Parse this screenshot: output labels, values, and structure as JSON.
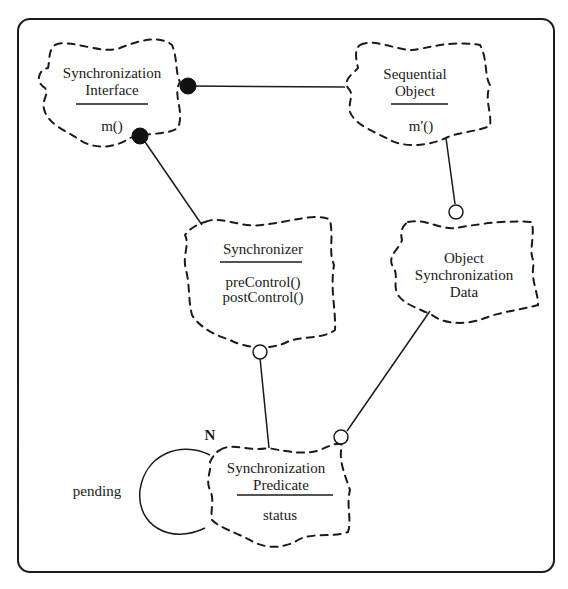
{
  "diagram": {
    "type": "Booch class diagram",
    "classes": [
      {
        "id": "synchronization-interface",
        "name_lines": [
          "Synchronization",
          "Interface"
        ],
        "operations": [
          "m()"
        ]
      },
      {
        "id": "sequential-object",
        "name_lines": [
          "Sequential",
          "Object"
        ],
        "operations": [
          "m'()"
        ]
      },
      {
        "id": "synchronizer",
        "name_lines": [
          "Synchronizer"
        ],
        "operations": [
          "preControl()",
          "postControl()"
        ]
      },
      {
        "id": "object-synchronization-data",
        "name_lines": [
          "Object",
          "Synchronization",
          "Data"
        ],
        "operations": []
      },
      {
        "id": "synchronization-predicate",
        "name_lines": [
          "Synchronization",
          "Predicate"
        ],
        "attributes": [
          "status"
        ]
      }
    ],
    "relations": [
      {
        "from": "synchronization-interface",
        "to": "sequential-object",
        "end_marker": "filled-circle"
      },
      {
        "from": "synchronization-interface",
        "to": "synchronizer",
        "end_marker": "filled-circle"
      },
      {
        "from": "sequential-object",
        "to": "object-synchronization-data",
        "end_marker": "open-circle"
      },
      {
        "from": "synchronizer",
        "to": "synchronization-predicate",
        "end_marker": "open-circle"
      },
      {
        "from": "object-synchronization-data",
        "to": "synchronization-predicate",
        "end_marker": "open-circle"
      },
      {
        "from": "synchronization-predicate",
        "to": "synchronization-predicate",
        "role": "pending",
        "cardinality": "N"
      }
    ],
    "labels": {
      "self_assoc_role": "pending",
      "self_assoc_cardinality": "N"
    }
  }
}
